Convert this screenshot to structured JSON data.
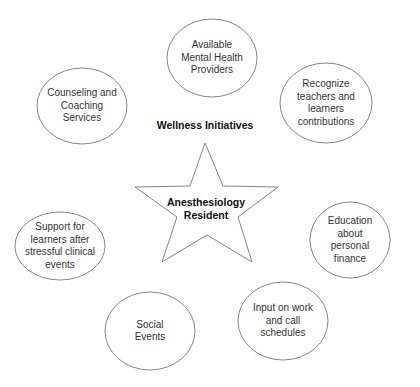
{
  "diagram": {
    "heading": "Wellness Initiatives",
    "center": {
      "line1": "Anesthesiology",
      "line2": "Resident",
      "shape": "star"
    },
    "nodes": [
      {
        "id": "mental-health",
        "lines": [
          "Available",
          "Mental Health",
          "Providers"
        ]
      },
      {
        "id": "recognize",
        "lines": [
          "Recognize",
          "teachers and",
          "learners",
          "contributions"
        ]
      },
      {
        "id": "finance",
        "lines": [
          "Education",
          "about",
          "personal",
          "finance"
        ]
      },
      {
        "id": "schedules",
        "lines": [
          "Input on work",
          "and call",
          "schedules"
        ]
      },
      {
        "id": "social",
        "lines": [
          "Social",
          "Events"
        ]
      },
      {
        "id": "support",
        "lines": [
          "Support for",
          "learners after",
          "stressful clinical",
          "events"
        ]
      },
      {
        "id": "counseling",
        "lines": [
          "Counseling and",
          "Coaching",
          "Services"
        ]
      }
    ],
    "colors": {
      "stroke": "#777777",
      "background": "#ffffff",
      "text": "#333333"
    }
  }
}
